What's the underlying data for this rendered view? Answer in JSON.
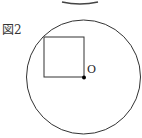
{
  "figure": {
    "label": "図2",
    "point_label": "O",
    "colors": {
      "stroke": "#333333",
      "point": "#000000",
      "background": "#ffffff"
    },
    "top_arc": {
      "cx": 80,
      "cy": -40,
      "rx": 32,
      "ry": 44
    },
    "circle": {
      "cx": 83.5,
      "cy": 77,
      "r": 57
    },
    "square": {
      "x": 44,
      "y": 37,
      "size": 40
    },
    "point": {
      "cx": 84,
      "cy": 78,
      "r": 2
    }
  }
}
